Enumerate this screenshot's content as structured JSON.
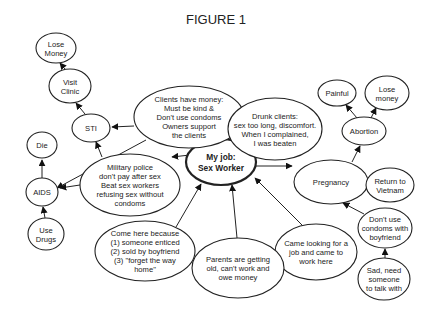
{
  "title": "FIGURE 1",
  "nodes": [
    {
      "id": "center",
      "lines": [
        "My job:",
        "Sex Worker"
      ],
      "cx": 221,
      "cy": 162,
      "rx": 35,
      "ry": 23,
      "center": true
    },
    {
      "id": "clients",
      "lines": [
        "Clients have money:",
        "Must be kind &",
        "Don't use condoms",
        "Owners support",
        "the clients"
      ],
      "cx": 189,
      "cy": 117,
      "rx": 55,
      "ry": 31
    },
    {
      "id": "drunk",
      "lines": [
        "Drunk clients:",
        "sex too long, discomfort.",
        "When I complained,",
        "I was beaten"
      ],
      "cx": 275,
      "cy": 129,
      "rx": 47,
      "ry": 31
    },
    {
      "id": "military",
      "lines": [
        "Military police",
        "don't pay after sex",
        "Beat sex workers",
        "refusing sex without",
        "condoms"
      ],
      "cx": 130,
      "cy": 185,
      "rx": 50,
      "ry": 31
    },
    {
      "id": "pregnancy",
      "lines": [
        "Pregnancy"
      ],
      "cx": 331,
      "cy": 182,
      "rx": 37,
      "ry": 22
    },
    {
      "id": "came_looking",
      "lines": [
        "Came looking for a",
        "job and came to",
        "work here"
      ],
      "cx": 316,
      "cy": 252,
      "rx": 41,
      "ry": 28
    },
    {
      "id": "parents",
      "lines": [
        "Parents are getting",
        "old, can't work and",
        "owe money"
      ],
      "cx": 238,
      "cy": 268,
      "rx": 46,
      "ry": 30
    },
    {
      "id": "come_here",
      "lines": [
        "Come here because",
        "(1) someone enticed",
        "(2) sold by boyfriend",
        "(3) \"forget the way",
        "home\""
      ],
      "cx": 145,
      "cy": 251,
      "rx": 50,
      "ry": 30
    },
    {
      "id": "sti",
      "lines": [
        "STI"
      ],
      "cx": 91,
      "cy": 128,
      "rx": 19,
      "ry": 14
    },
    {
      "id": "visit_clinic",
      "lines": [
        "Visit",
        "Clinic"
      ],
      "cx": 70,
      "cy": 86,
      "rx": 21,
      "ry": 17
    },
    {
      "id": "lose_money_l",
      "lines": [
        "Lose",
        "Money"
      ],
      "cx": 56,
      "cy": 48,
      "rx": 20,
      "ry": 15
    },
    {
      "id": "die",
      "lines": [
        "Die"
      ],
      "cx": 42,
      "cy": 145,
      "rx": 15,
      "ry": 13
    },
    {
      "id": "aids",
      "lines": [
        "AIDS"
      ],
      "cx": 42,
      "cy": 192,
      "rx": 16,
      "ry": 14
    },
    {
      "id": "use_drugs",
      "lines": [
        "Use",
        "Drugs"
      ],
      "cx": 46,
      "cy": 234,
      "rx": 18,
      "ry": 16
    },
    {
      "id": "abortion",
      "lines": [
        "Abortion"
      ],
      "cx": 364,
      "cy": 131,
      "rx": 22,
      "ry": 14
    },
    {
      "id": "painful",
      "lines": [
        "Painful"
      ],
      "cx": 337,
      "cy": 93,
      "rx": 19,
      "ry": 13
    },
    {
      "id": "lose_money_r",
      "lines": [
        "Lose",
        "money"
      ],
      "cx": 387,
      "cy": 93,
      "rx": 22,
      "ry": 17
    },
    {
      "id": "return_vietnam",
      "lines": [
        "Return to",
        "Vietnam"
      ],
      "cx": 390,
      "cy": 185,
      "rx": 24,
      "ry": 17
    },
    {
      "id": "dont_use",
      "lines": [
        "Don't use",
        "condoms with",
        "boyfriend"
      ],
      "cx": 385,
      "cy": 228,
      "rx": 27,
      "ry": 20
    },
    {
      "id": "sad",
      "lines": [
        "Sad, need",
        "someone",
        "to talk with"
      ],
      "cx": 384,
      "cy": 279,
      "rx": 26,
      "ry": 21
    }
  ],
  "edges": [
    {
      "from": [
        214,
        139
      ],
      "to": [
        211,
        128
      ],
      "arrow": true,
      "label": "center-to-clients"
    },
    {
      "from": [
        232,
        140
      ],
      "to": [
        246,
        128
      ],
      "arrow": true,
      "label": "center-to-drunk"
    },
    {
      "from": [
        190,
        155
      ],
      "to": [
        172,
        157
      ],
      "arrow": true,
      "label": "center-to-military"
    },
    {
      "from": [
        256,
        166
      ],
      "to": [
        292,
        166
      ],
      "arrow": true,
      "label": "center-to-pregnancy"
    },
    {
      "from": [
        305,
        228
      ],
      "to": [
        255,
        178
      ],
      "arrow": true,
      "label": "came-looking-to-center"
    },
    {
      "from": [
        237,
        238
      ],
      "to": [
        232,
        185
      ],
      "arrow": true,
      "label": "parents-to-center"
    },
    {
      "from": [
        176,
        227
      ],
      "to": [
        201,
        184
      ],
      "arrow": true,
      "label": "come-here-to-center"
    },
    {
      "from": [
        134,
        126
      ],
      "to": [
        112,
        127
      ],
      "arrow": true,
      "label": "clients-to-sti"
    },
    {
      "from": [
        146,
        140
      ],
      "to": [
        57,
        188
      ],
      "arrow": true,
      "label": "clients-to-aids"
    },
    {
      "from": [
        102,
        157
      ],
      "to": [
        96,
        142
      ],
      "arrow": true,
      "label": "military-to-sti"
    },
    {
      "from": [
        80,
        185
      ],
      "to": [
        60,
        188
      ],
      "arrow": true,
      "label": "military-to-aids"
    },
    {
      "from": [
        85,
        114
      ],
      "to": [
        76,
        103
      ],
      "arrow": true,
      "label": "sti-to-visit-clinic"
    },
    {
      "from": [
        65,
        69
      ],
      "to": [
        60,
        63
      ],
      "arrow": true,
      "label": "visit-clinic-to-lose-money"
    },
    {
      "from": [
        42,
        178
      ],
      "to": [
        42,
        160
      ],
      "arrow": true,
      "label": "aids-to-die"
    },
    {
      "from": [
        45,
        218
      ],
      "to": [
        43,
        207
      ],
      "arrow": true,
      "label": "use-drugs-to-aids"
    },
    {
      "from": [
        352,
        162
      ],
      "to": [
        360,
        146
      ],
      "arrow": true,
      "label": "pregnancy-to-abortion"
    },
    {
      "from": [
        357,
        118
      ],
      "to": [
        346,
        105
      ],
      "arrow": true,
      "label": "abortion-to-painful"
    },
    {
      "from": [
        371,
        118
      ],
      "to": [
        376,
        108
      ],
      "arrow": true,
      "label": "abortion-to-lose-money"
    },
    {
      "from": [
        368,
        183
      ],
      "to": [
        365,
        184
      ],
      "arrow": true,
      "label": "pregnancy-to-return"
    },
    {
      "from": [
        364,
        214
      ],
      "to": [
        343,
        203
      ],
      "arrow": true,
      "label": "dont-use-to-pregnancy"
    },
    {
      "from": [
        385,
        258
      ],
      "to": [
        385,
        249
      ],
      "arrow": true,
      "label": "sad-to-dont-use"
    }
  ]
}
